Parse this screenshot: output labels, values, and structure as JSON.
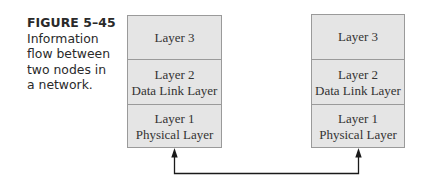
{
  "caption": {
    "figure_number": "FIGURE 5–45",
    "lines": [
      "Information",
      "flow between",
      "two nodes in",
      "a network."
    ]
  },
  "nodes": [
    {
      "layers": [
        {
          "lines": [
            "Layer 3"
          ]
        },
        {
          "lines": [
            "Layer 2",
            "Data Link Layer"
          ]
        },
        {
          "lines": [
            "Layer 1",
            "Physical Layer"
          ]
        }
      ]
    },
    {
      "layers": [
        {
          "lines": [
            "Layer 3"
          ]
        },
        {
          "lines": [
            "Layer 2",
            "Data Link Layer"
          ]
        },
        {
          "lines": [
            "Layer 1",
            "Physical Layer"
          ]
        }
      ]
    }
  ],
  "colors": {
    "box_fill": "#e5e5e5",
    "box_border": "#9a9a9a",
    "text": "#333333",
    "line": "#1a1a1a"
  }
}
